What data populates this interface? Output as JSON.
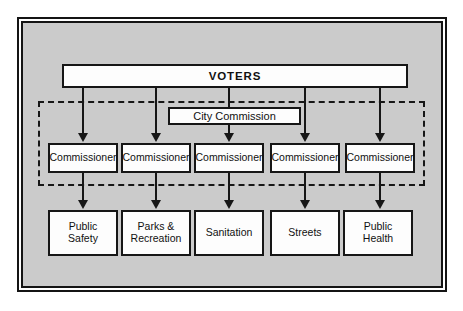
{
  "figure": {
    "type": "organizational-chart",
    "colors": {
      "page_background": "#ffffff",
      "panel_background": "#cbcbcb",
      "frame_line": "#141414",
      "box_fill": "#fdfdfd",
      "box_border": "#161616",
      "text": "#111111"
    }
  },
  "top_node": {
    "label": "VOTERS"
  },
  "governing_body": {
    "label": "City Commission",
    "boundary_style": "dashed"
  },
  "commissioners": [
    {
      "label": "Commissioner"
    },
    {
      "label": "Commissioner"
    },
    {
      "label": "Commissioner"
    },
    {
      "label": "Commissioner"
    },
    {
      "label": "Commissioner"
    }
  ],
  "departments": [
    {
      "line1": "Public",
      "line2": "Safety"
    },
    {
      "line1": "Parks &",
      "line2": "Recreation"
    },
    {
      "line1": "Sanitation",
      "line2": ""
    },
    {
      "line1": "Streets",
      "line2": ""
    },
    {
      "line1": "Public",
      "line2": "Health"
    }
  ]
}
